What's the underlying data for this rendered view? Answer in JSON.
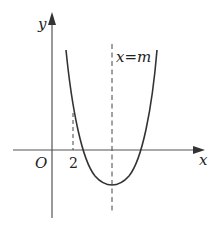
{
  "diagram": {
    "type": "function-graph",
    "axes": {
      "x_label": "x",
      "y_label": "y",
      "origin_label": "O"
    },
    "tick_labels": [
      "2"
    ],
    "axis_of_symmetry_label": "x=m",
    "curve": "upward-opening parabola with vertex below x-axis, axis of symmetry x=m, to the right of x=2",
    "colors": {
      "line": "#333333",
      "axis": "#555555",
      "background": "#ffffff"
    }
  }
}
